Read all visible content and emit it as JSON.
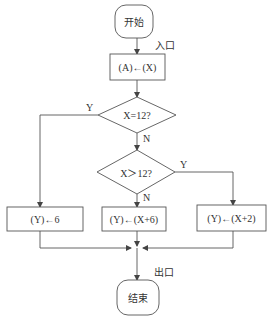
{
  "diagram": {
    "type": "flowchart",
    "colors": {
      "stroke": "#555555",
      "text": "#333333",
      "background": "#ffffff"
    },
    "nodes": {
      "start": {
        "kind": "terminal",
        "label": "开始"
      },
      "assign_a": {
        "kind": "process",
        "label": "(A)←(X)"
      },
      "decision_eq": {
        "kind": "decision",
        "label": "X=12?"
      },
      "decision_gt": {
        "kind": "decision",
        "label": "X＞12?"
      },
      "proc_left": {
        "kind": "process",
        "label": "(Y)←6"
      },
      "proc_mid": {
        "kind": "process",
        "label": "(Y)←(X+6)"
      },
      "proc_right": {
        "kind": "process",
        "label": "(Y)←(X+2)"
      },
      "end": {
        "kind": "terminal",
        "label": "结束"
      }
    },
    "annotations": {
      "entry": "入口",
      "exit": "出口",
      "eq_yes": "Y",
      "eq_no": "N",
      "gt_yes": "Y",
      "gt_no": "N"
    },
    "edges": [
      {
        "from": "start",
        "to": "assign_a",
        "label": "入口"
      },
      {
        "from": "assign_a",
        "to": "decision_eq"
      },
      {
        "from": "decision_eq",
        "to": "proc_left",
        "label": "Y"
      },
      {
        "from": "decision_eq",
        "to": "decision_gt",
        "label": "N"
      },
      {
        "from": "decision_gt",
        "to": "proc_right",
        "label": "Y"
      },
      {
        "from": "decision_gt",
        "to": "proc_mid",
        "label": "N"
      },
      {
        "from": "proc_left",
        "to": "end"
      },
      {
        "from": "proc_mid",
        "to": "end"
      },
      {
        "from": "proc_right",
        "to": "end",
        "label": "出口"
      }
    ]
  }
}
